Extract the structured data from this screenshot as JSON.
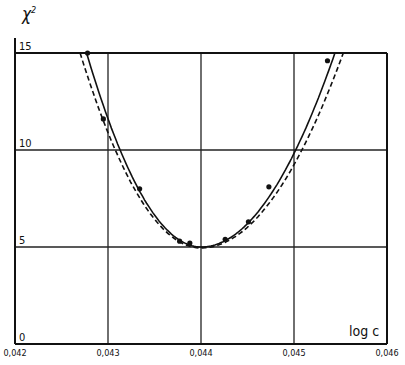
{
  "chart_data": {
    "type": "line",
    "title": "",
    "xlabel": "log c",
    "ylabel": "χ²",
    "xlim": [
      0.042,
      0.046
    ],
    "ylim": [
      0,
      15
    ],
    "grid": true,
    "x_ticks": [
      0.042,
      0.043,
      0.044,
      0.045,
      0.046
    ],
    "x_tick_labels": [
      "0,042",
      "0,043",
      "0,044",
      "0,045",
      "0,046"
    ],
    "y_ticks": [
      0,
      5,
      10,
      15
    ],
    "y_tick_labels": [
      "0",
      "5",
      "10",
      "15"
    ],
    "legend": null,
    "series": [
      {
        "name": "fitted curve (solid)",
        "style": "solid",
        "vertex": {
          "x": 0.044,
          "y": 5.0
        },
        "x": [
          0.04277,
          0.043,
          0.0432,
          0.0434,
          0.0436,
          0.0438,
          0.044,
          0.0442,
          0.0444,
          0.0446,
          0.0448,
          0.045,
          0.0452,
          0.04544
        ],
        "values": [
          15.0,
          11.4,
          8.8,
          6.9,
          5.7,
          5.1,
          5.0,
          5.2,
          5.8,
          7.0,
          8.7,
          10.8,
          13.4,
          15.0
        ]
      },
      {
        "name": "fitted curve (dashed)",
        "style": "dashed",
        "vertex": {
          "x": 0.044,
          "y": 4.95
        },
        "x": [
          0.0427,
          0.043,
          0.0432,
          0.0434,
          0.0436,
          0.0438,
          0.044,
          0.0442,
          0.0444,
          0.0446,
          0.0448,
          0.045,
          0.0452,
          0.04553
        ],
        "values": [
          15.0,
          11.0,
          8.5,
          6.7,
          5.6,
          5.05,
          4.95,
          5.15,
          5.7,
          6.8,
          8.4,
          10.4,
          12.8,
          15.0
        ]
      },
      {
        "name": "measured points",
        "style": "markers",
        "x": [
          0.04278,
          0.04295,
          0.04334,
          0.04377,
          0.04388,
          0.04426,
          0.04451,
          0.04473,
          0.04536
        ],
        "values": [
          15.0,
          11.6,
          8.0,
          5.3,
          5.2,
          5.4,
          6.3,
          8.1,
          14.6
        ]
      }
    ]
  },
  "axes": {
    "y_title": "χ",
    "y_title_sup": "2",
    "x_title": "log c"
  }
}
